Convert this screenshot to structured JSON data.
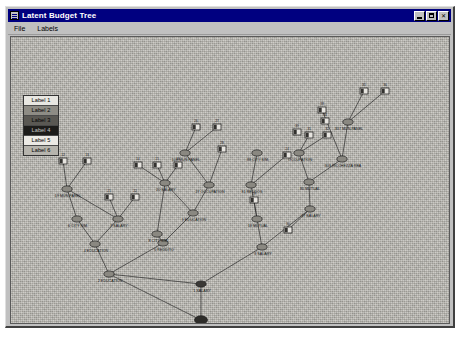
{
  "window": {
    "title": "Latent Budget Tree",
    "icon": "app-window-icon",
    "buttons": [
      {
        "name": "minimize-button",
        "glyph": "_"
      },
      {
        "name": "maximize-button",
        "glyph": "□"
      },
      {
        "name": "close-button",
        "glyph": "✕"
      }
    ]
  },
  "menubar": {
    "items": [
      {
        "name": "menu-file",
        "label": "File"
      },
      {
        "name": "menu-labels",
        "label": "Labels"
      }
    ]
  },
  "legend": {
    "title": "category-legend",
    "rows": [
      {
        "label": "Label 1",
        "fill": "#e8e7e2",
        "text": "#000000"
      },
      {
        "label": "Label 2",
        "fill": "#8e8c85",
        "text": "#000000"
      },
      {
        "label": "Label 3",
        "fill": "#5a5853",
        "text": "#000000"
      },
      {
        "label": "Label 4",
        "fill": "#1d1c1a",
        "text": "#c9c8c4"
      },
      {
        "label": "Label 5",
        "fill": "#eceae5",
        "text": "#000000"
      },
      {
        "label": "Label 6",
        "fill": "#b6b4ad",
        "text": "#000000"
      }
    ]
  },
  "canvas": {
    "name": "tree-canvas",
    "background": "#b4b2ab"
  },
  "chart_data": {
    "type": "diagram",
    "title": "Latent Budget Tree",
    "nodes": [
      {
        "id": "n1",
        "x": 190,
        "y": 247,
        "label": "1 SALARY",
        "shape": "ellipse",
        "fill": "#3a3936"
      },
      {
        "id": "n2",
        "x": 98,
        "y": 237,
        "label": "2 EDUCATION",
        "shape": "ellipse",
        "fill": "#8a8881"
      },
      {
        "id": "n3",
        "x": 251,
        "y": 210,
        "label": "3 SALARY",
        "shape": "ellipse",
        "fill": "#8a8881"
      },
      {
        "id": "n4",
        "x": 84,
        "y": 207,
        "label": "4 EDUCATION",
        "shape": "ellipse",
        "fill": "#8a8881"
      },
      {
        "id": "n5",
        "x": 152,
        "y": 206,
        "label": "5 REDDITO",
        "shape": "ellipse",
        "fill": "#8a8881"
      },
      {
        "id": "n6",
        "x": 66,
        "y": 182,
        "label": "6 CITY SIM.",
        "shape": "ellipse",
        "fill": "#8a8881"
      },
      {
        "id": "n7",
        "x": 107,
        "y": 182,
        "label": "7 SALARY",
        "shape": "ellipse",
        "fill": "#8a8881"
      },
      {
        "id": "n8",
        "x": 146,
        "y": 197,
        "label": "8 CITY SIM",
        "shape": "ellipse",
        "fill": "#8a8881"
      },
      {
        "id": "n9",
        "x": 182,
        "y": 176,
        "label": "9 EDUCATION",
        "shape": "ellipse",
        "fill": "#8a8881"
      },
      {
        "id": "n10",
        "x": 56,
        "y": 152,
        "label": "19 MUN.PANEL",
        "shape": "ellipse",
        "fill": "#8a8881"
      },
      {
        "id": "n11",
        "x": 154,
        "y": 146,
        "label": "20 SALARY",
        "shape": "ellipse",
        "fill": "#8a8881"
      },
      {
        "id": "n12",
        "x": 198,
        "y": 148,
        "label": "27 OCCUPATION",
        "shape": "ellipse",
        "fill": "#8a8881"
      },
      {
        "id": "n13",
        "x": 174,
        "y": 116,
        "label": "108 MUN.PANEL",
        "shape": "ellipse",
        "fill": "#8a8881"
      },
      {
        "id": "n14",
        "x": 246,
        "y": 182,
        "label": "18 MUTUAL",
        "shape": "ellipse",
        "fill": "#8a8881"
      },
      {
        "id": "n15",
        "x": 299,
        "y": 172,
        "label": "37 SALARY",
        "shape": "ellipse",
        "fill": "#8a8881"
      },
      {
        "id": "n16",
        "x": 240,
        "y": 148,
        "label": "81 REDDOS",
        "shape": "ellipse",
        "fill": "#8a8881"
      },
      {
        "id": "n17",
        "x": 298,
        "y": 145,
        "label": "80 MUTUAL",
        "shape": "ellipse",
        "fill": "#8a8881"
      },
      {
        "id": "n18",
        "x": 246,
        "y": 116,
        "label": "88 CITY SIM.",
        "shape": "ellipse",
        "fill": "#8a8881"
      },
      {
        "id": "n19",
        "x": 288,
        "y": 116,
        "label": "OCCUPATION",
        "shape": "ellipse",
        "fill": "#8a8881"
      },
      {
        "id": "n20",
        "x": 331,
        "y": 122,
        "label": "303 RICCHEZZA REA",
        "shape": "ellipse",
        "fill": "#8a8881"
      },
      {
        "id": "n21",
        "x": 337,
        "y": 85,
        "label": "307 MUN.PANEL",
        "shape": "ellipse",
        "fill": "#8a8881"
      }
    ],
    "leaves": [
      {
        "id": "L12",
        "x": 52,
        "y": 124,
        "label": "12"
      },
      {
        "id": "L13",
        "x": 76,
        "y": 124,
        "label": "13"
      },
      {
        "id": "L14",
        "x": 127,
        "y": 128,
        "label": "14"
      },
      {
        "id": "L15",
        "x": 146,
        "y": 128,
        "label": "15"
      },
      {
        "id": "L16",
        "x": 167,
        "y": 128,
        "label": "16"
      },
      {
        "id": "L21",
        "x": 98,
        "y": 160,
        "label": "21"
      },
      {
        "id": "L22",
        "x": 124,
        "y": 160,
        "label": "22"
      },
      {
        "id": "L26",
        "x": 185,
        "y": 90,
        "label": "26"
      },
      {
        "id": "L27",
        "x": 206,
        "y": 90,
        "label": "27"
      },
      {
        "id": "L28",
        "x": 211,
        "y": 112,
        "label": "28"
      },
      {
        "id": "L24",
        "x": 276,
        "y": 118,
        "label": "24"
      },
      {
        "id": "L29",
        "x": 243,
        "y": 163,
        "label": "29"
      },
      {
        "id": "L30",
        "x": 277,
        "y": 193,
        "label": "30"
      },
      {
        "id": "L31",
        "x": 298,
        "y": 98,
        "label": "31"
      },
      {
        "id": "L32",
        "x": 316,
        "y": 98,
        "label": "32"
      },
      {
        "id": "L34",
        "x": 314,
        "y": 84,
        "label": "34"
      },
      {
        "id": "L35",
        "x": 353,
        "y": 54,
        "label": "35"
      },
      {
        "id": "L36",
        "x": 374,
        "y": 54,
        "label": "36"
      },
      {
        "id": "L38",
        "x": 311,
        "y": 73,
        "label": "38"
      },
      {
        "id": "L39",
        "x": 286,
        "y": 95,
        "label": "39"
      }
    ],
    "edges": [
      [
        "n1",
        "n2"
      ],
      [
        "n1",
        "n3"
      ],
      [
        "n2",
        "n4"
      ],
      [
        "n2",
        "n5"
      ],
      [
        "n4",
        "n6"
      ],
      [
        "n4",
        "n7"
      ],
      [
        "n5",
        "n8"
      ],
      [
        "n5",
        "n9"
      ],
      [
        "n6",
        "n10"
      ],
      [
        "n7",
        "n10"
      ],
      [
        "n7",
        "L21"
      ],
      [
        "n7",
        "L22"
      ],
      [
        "n10",
        "L12"
      ],
      [
        "n10",
        "L13"
      ],
      [
        "n8",
        "n11"
      ],
      [
        "n9",
        "n11"
      ],
      [
        "n9",
        "n12"
      ],
      [
        "n11",
        "L14"
      ],
      [
        "n11",
        "L15"
      ],
      [
        "n11",
        "L16"
      ],
      [
        "n12",
        "n13"
      ],
      [
        "n13",
        "L26"
      ],
      [
        "n13",
        "L27"
      ],
      [
        "n12",
        "L28"
      ],
      [
        "n3",
        "n14"
      ],
      [
        "n3",
        "n15"
      ],
      [
        "n14",
        "n16"
      ],
      [
        "n14",
        "L29"
      ],
      [
        "n15",
        "n17"
      ],
      [
        "n15",
        "L30"
      ],
      [
        "n16",
        "n18"
      ],
      [
        "n16",
        "L24"
      ],
      [
        "n17",
        "n19"
      ],
      [
        "n17",
        "n20"
      ],
      [
        "n19",
        "L31"
      ],
      [
        "n19",
        "L32"
      ],
      [
        "n20",
        "n21"
      ],
      [
        "n20",
        "L38"
      ],
      [
        "n21",
        "L35"
      ],
      [
        "n21",
        "L36"
      ]
    ],
    "root": {
      "id": "n0",
      "x": 190,
      "y": 283,
      "label": "EDUCATION",
      "fill": "#2e2d2a"
    }
  }
}
